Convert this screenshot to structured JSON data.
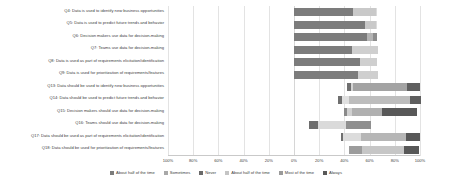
{
  "chart_data": {
    "type": "bar",
    "variant": "diverging-stacked-likert",
    "title": "",
    "xlabel": "",
    "ylabel": "",
    "grid": true,
    "legend_position": "bottom",
    "xlim": [
      -100,
      100
    ],
    "xtick_labels": [
      "100%",
      "80%",
      "60%",
      "40%",
      "20%",
      "0%",
      "20%",
      "40%",
      "60%",
      "80%",
      "100%"
    ],
    "xtick_values": [
      -100,
      -80,
      -60,
      -40,
      -20,
      0,
      20,
      40,
      60,
      80,
      100
    ],
    "legend": [
      {
        "label": "About half of the time",
        "color": "#7c7c7c"
      },
      {
        "label": "Sometimes",
        "color": "#a8a8a8"
      },
      {
        "label": "Never",
        "color": "#6a6a6a"
      },
      {
        "label": "About half of the time",
        "color": "#c4c4c4"
      },
      {
        "label": "Most of the time",
        "color": "#9a9a9a"
      },
      {
        "label": "Always",
        "color": "#595959"
      }
    ],
    "categories": [
      "Q4: Data is used to identify new business opportunities",
      "Q5: Data is used to predict future trends and behavior",
      "Q6: Decision makers use data for decision-making",
      "Q7: Teams use data for decision-making",
      "Q8: Data is used as part of requirements elicitation/identification",
      "Q9: Data is used for prioritization of requirements/features",
      "Q13: Data should be used to identify new business opportunities",
      "Q14: Data should be used to predict future trends and behavior",
      "Q15: Decision makers should use data for decision-making",
      "Q16: Teams should use data for decision-making",
      "Q17: Data should be used as part of requirements elicitation/identification",
      "Q18: Data should be used for prioritization of requirements/features"
    ],
    "rows": [
      {
        "category": "Q4: Data is used to identify new business opportunities",
        "start": 0,
        "segments": [
          {
            "name": "Never",
            "value": 47,
            "color": "#7c7c7c"
          },
          {
            "name": "Sometimes",
            "value": 18,
            "color": "#c9c9c9"
          },
          {
            "name": "About half of the time",
            "value": 1,
            "color": "#dcdcdc"
          }
        ]
      },
      {
        "category": "Q5: Data is used to predict future trends and behavior",
        "start": 0,
        "segments": [
          {
            "name": "Never",
            "value": 56,
            "color": "#7c7c7c"
          },
          {
            "name": "Sometimes",
            "value": 9,
            "color": "#c9c9c9"
          },
          {
            "name": "About half of the time",
            "value": 1,
            "color": "#dcdcdc"
          }
        ]
      },
      {
        "category": "Q6: Decision makers use data for decision-making",
        "start": 0,
        "segments": [
          {
            "name": "Never",
            "value": 58,
            "color": "#7c7c7c"
          },
          {
            "name": "Sometimes",
            "value": 5,
            "color": "#b4b4b4"
          },
          {
            "name": "About half of the time",
            "value": 3,
            "color": "#8d8d8d"
          }
        ]
      },
      {
        "category": "Q7: Teams use data for decision-making",
        "start": 0,
        "segments": [
          {
            "name": "Never",
            "value": 46,
            "color": "#7c7c7c"
          },
          {
            "name": "Sometimes",
            "value": 21,
            "color": "#cfcfcf"
          }
        ]
      },
      {
        "category": "Q8: Data is used as part of requirements elicitation/identification",
        "start": 0,
        "segments": [
          {
            "name": "Never",
            "value": 52,
            "color": "#7c7c7c"
          },
          {
            "name": "Sometimes",
            "value": 14,
            "color": "#cfcfcf"
          }
        ]
      },
      {
        "category": "Q9: Data is used for prioritization of requirements/features",
        "start": 0,
        "segments": [
          {
            "name": "Never",
            "value": 51,
            "color": "#7c7c7c"
          },
          {
            "name": "Sometimes",
            "value": 16,
            "color": "#cfcfcf"
          }
        ]
      },
      {
        "category": "Q13: Data should be used to identify new business opportunities",
        "start": 42,
        "segments": [
          {
            "name": "Sometimes",
            "value": 3,
            "color": "#6f6f6f"
          },
          {
            "name": "About half of the time",
            "value": 2,
            "color": "#d4d4d4"
          },
          {
            "name": "Most of the time",
            "value": 43,
            "color": "#a3a3a3"
          },
          {
            "name": "Always",
            "value": 10,
            "color": "#5f5f5f"
          }
        ]
      },
      {
        "category": "Q14: Data should be used to predict future trends and behavior",
        "start": 35,
        "segments": [
          {
            "name": "Sometimes",
            "value": 3,
            "color": "#6f6f6f"
          },
          {
            "name": "About half of the time",
            "value": 6,
            "color": "#e0e0e0"
          },
          {
            "name": "Most of the time",
            "value": 48,
            "color": "#bdbdbd"
          },
          {
            "name": "Always",
            "value": 9,
            "color": "#5f5f5f"
          }
        ]
      },
      {
        "category": "Q15: Decision makers should use data for decision-making",
        "start": 40,
        "segments": [
          {
            "name": "Sometimes",
            "value": 2,
            "color": "#8a8a8a"
          },
          {
            "name": "About half of the time",
            "value": 4,
            "color": "#d0d0d0"
          },
          {
            "name": "Most of the time",
            "value": 24,
            "color": "#b0b0b0"
          },
          {
            "name": "Always",
            "value": 28,
            "color": "#585858"
          }
        ]
      },
      {
        "category": "Q16: Teams should use data for decision-making",
        "start": 12,
        "segments": [
          {
            "name": "Never",
            "value": 7,
            "color": "#6d6d6d"
          },
          {
            "name": "Sometimes",
            "value": 22,
            "color": "#dadada"
          },
          {
            "name": "About half of the time",
            "value": 20,
            "color": "#8f8f8f"
          }
        ]
      },
      {
        "category": "Q17: Data should be used as part of requirements elicitation/identification",
        "start": 37,
        "segments": [
          {
            "name": "Sometimes",
            "value": 2,
            "color": "#6f6f6f"
          },
          {
            "name": "About half of the time",
            "value": 14,
            "color": "#dcdcdc"
          },
          {
            "name": "Most of the time",
            "value": 36,
            "color": "#b6b6b6"
          },
          {
            "name": "Always",
            "value": 11,
            "color": "#585858"
          }
        ]
      },
      {
        "category": "Q18: Data should be used for prioritization of requirements/features",
        "start": 44,
        "segments": [
          {
            "name": "About half of the time",
            "value": 10,
            "color": "#9c9c9c"
          },
          {
            "name": "Most of the time",
            "value": 33,
            "color": "#c6c6c6"
          },
          {
            "name": "Always",
            "value": 12,
            "color": "#585858"
          }
        ]
      }
    ]
  }
}
